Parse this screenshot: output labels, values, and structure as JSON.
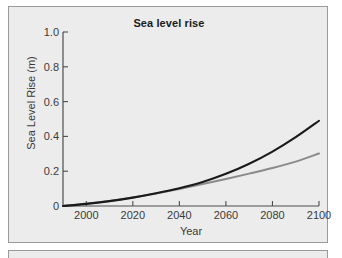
{
  "figure": {
    "background_color": "#ffffff",
    "panel_color": "#ececed",
    "panel_border_color": "#9a9a9a"
  },
  "chart_data": {
    "type": "line",
    "title": "Sea level rise",
    "xlabel": "Year",
    "ylabel": "Sea Level Rise (m)",
    "xlim": [
      1990,
      2100
    ],
    "ylim": [
      0,
      1.0
    ],
    "grid": false,
    "legend": null,
    "xticks": [
      2000,
      2020,
      2040,
      2060,
      2080,
      2100
    ],
    "xtick_labels": [
      "2000",
      "2020",
      "2040",
      "2060",
      "2080",
      "2100"
    ],
    "yticks": [
      0,
      0.2,
      0.4,
      0.6,
      0.8,
      1.0
    ],
    "ytick_labels": [
      "0",
      "0.2",
      "0.4",
      "0.6",
      "0.8",
      "1.0"
    ],
    "x": [
      1990,
      2000,
      2010,
      2020,
      2030,
      2040,
      2050,
      2060,
      2070,
      2080,
      2090,
      2100
    ],
    "series": [
      {
        "name": "High scenario",
        "color": "#1a1a1a",
        "line_width": 2.1,
        "values": [
          0.0,
          0.012,
          0.028,
          0.048,
          0.073,
          0.102,
          0.138,
          0.185,
          0.243,
          0.313,
          0.396,
          0.49
        ]
      },
      {
        "name": "Low scenario",
        "color": "#8a8a8a",
        "line_width": 2.0,
        "values": [
          0.0,
          0.013,
          0.029,
          0.049,
          0.072,
          0.098,
          0.126,
          0.155,
          0.186,
          0.218,
          0.255,
          0.302
        ]
      }
    ]
  }
}
